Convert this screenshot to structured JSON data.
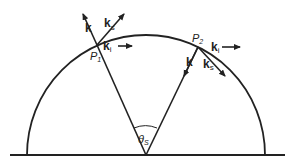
{
  "diagram": {
    "type": "geometry-scattering",
    "colors": {
      "stroke": "#222222",
      "background": "#ffffff"
    },
    "points": {
      "p1": {
        "label": "P",
        "sub": "1"
      },
      "p2": {
        "label": "P",
        "sub": "2"
      }
    },
    "vectors": {
      "p1_k": {
        "label": "k",
        "sub": ""
      },
      "p1_ks": {
        "label": "k",
        "sub": "s"
      },
      "p1_ki": {
        "label": "k",
        "sub": "i"
      },
      "p2_k": {
        "label": "k",
        "sub": ""
      },
      "p2_ks": {
        "label": "k",
        "sub": "s"
      },
      "p2_ki": {
        "label": "k",
        "sub": "i"
      }
    },
    "angle": {
      "label": "θ",
      "sub": "S"
    }
  }
}
